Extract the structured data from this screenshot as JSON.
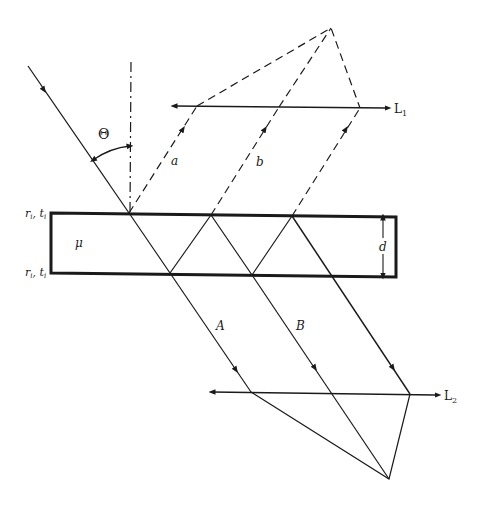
{
  "diagram": {
    "type": "thin-film-interference",
    "labels": {
      "theta": "Θ",
      "ray_a": "a",
      "ray_b": "b",
      "ray_A": "A",
      "ray_B": "B",
      "mu": "μ",
      "thickness": "d",
      "top_surface": "r",
      "top_surface_sub": "i",
      "top_surface_t": "t",
      "top_surface_t_sub": "i",
      "bottom_surface": "r",
      "bottom_surface_sub": "i",
      "bottom_surface_t": "t",
      "bottom_surface_t_sub": "i",
      "lens1": "L",
      "lens1_sub": "1",
      "lens2": "L",
      "lens2_sub": "2"
    },
    "colors": {
      "ink": "#1a1a1a",
      "background": "#ffffff"
    }
  }
}
